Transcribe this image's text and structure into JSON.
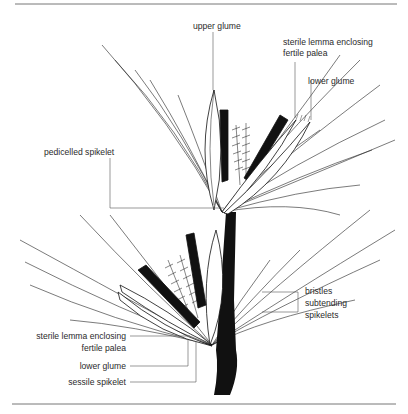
{
  "diagram": {
    "labels": {
      "upper_glume": "upper glume",
      "sterile_lemma_top_1": "sterile lemma enclosing",
      "sterile_lemma_top_2": "fertile palea",
      "lower_glume_top": "lower glume",
      "pedicelled_spikelet": "pedicelled spikelet",
      "bristles_1": "bristles",
      "bristles_2": "subtending",
      "bristles_3": "spikelets",
      "sterile_lemma_bottom_1": "sterile lemma enclosing",
      "sterile_lemma_bottom_2": "fertile palea",
      "lower_glume_bottom": "lower glume",
      "sessile_spikelet": "sessile spikelet"
    },
    "colors": {
      "ink": "#1a1a1a",
      "rule": "#777777",
      "label": "#2a2a2a"
    }
  }
}
